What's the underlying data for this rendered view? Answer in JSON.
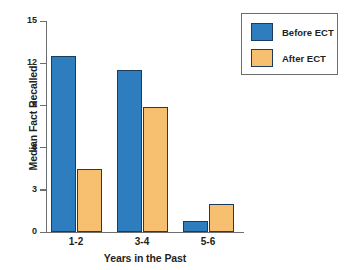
{
  "chart_data": {
    "type": "bar",
    "title": "",
    "xlabel": "Years in the Past",
    "ylabel": "Median Fact Recalled",
    "categories": [
      "1-2",
      "3-4",
      "5-6"
    ],
    "series": [
      {
        "name": "Before ECT",
        "color": "#2e7ebf",
        "values": [
          12.5,
          11.5,
          0.8
        ]
      },
      {
        "name": "After ECT",
        "color": "#f7c070",
        "values": [
          4.5,
          8.9,
          2.0
        ]
      }
    ],
    "ylim": [
      0,
      15
    ],
    "yticks": [
      0,
      3,
      6,
      9,
      12,
      15
    ],
    "ytick_labels": [
      "0",
      "3",
      "6",
      "9",
      "12",
      "15"
    ],
    "grid": false,
    "legend_position": "upper right",
    "bar_outline_color": "#1b3c5e",
    "axis_color": "#6d6e71"
  },
  "legend": {
    "entries": [
      {
        "label": "Before ECT"
      },
      {
        "label": "After ECT"
      }
    ]
  }
}
